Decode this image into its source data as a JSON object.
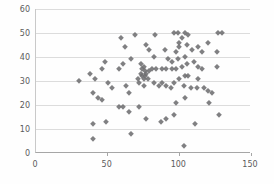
{
  "chart_data": {
    "type": "scatter",
    "title": "",
    "xlabel": "",
    "ylabel": "",
    "xlim": [
      0,
      150
    ],
    "ylim": [
      0,
      60
    ],
    "x_ticks": [
      0,
      50,
      100,
      150
    ],
    "y_ticks": [
      0,
      10,
      20,
      30,
      40,
      50,
      60
    ],
    "grid": "horizontal",
    "legend": "none",
    "marker": {
      "shape": "diamond",
      "color": "#6e6e71",
      "size_px": 5
    },
    "colors": {
      "background": "#fefefe",
      "gridline": "#dcdcdc",
      "axis_line": "#a6a6a6",
      "tick_text": "#5b5b5b"
    },
    "points": [
      [
        30,
        30
      ],
      [
        38,
        33
      ],
      [
        41,
        31
      ],
      [
        40,
        25
      ],
      [
        43,
        23
      ],
      [
        46,
        22
      ],
      [
        48,
        38
      ],
      [
        46,
        35
      ],
      [
        50,
        29
      ],
      [
        53,
        27
      ],
      [
        40,
        12
      ],
      [
        49,
        13
      ],
      [
        40,
        6
      ],
      [
        59,
        48
      ],
      [
        69,
        49
      ],
      [
        58,
        35
      ],
      [
        61,
        37
      ],
      [
        66,
        39
      ],
      [
        62,
        44
      ],
      [
        63,
        28
      ],
      [
        65,
        25
      ],
      [
        58,
        19
      ],
      [
        61,
        19
      ],
      [
        65,
        17
      ],
      [
        66,
        8
      ],
      [
        72,
        19
      ],
      [
        71,
        31
      ],
      [
        77,
        45
      ],
      [
        73,
        37
      ],
      [
        74,
        35
      ],
      [
        75,
        36
      ],
      [
        76,
        34
      ],
      [
        73,
        33
      ],
      [
        74,
        32
      ],
      [
        76,
        32
      ],
      [
        77,
        33
      ],
      [
        78,
        31
      ],
      [
        75,
        31
      ],
      [
        79,
        43
      ],
      [
        82,
        40
      ],
      [
        79,
        34
      ],
      [
        81,
        35
      ],
      [
        84,
        35
      ],
      [
        88,
        35
      ],
      [
        91,
        35
      ],
      [
        95,
        35
      ],
      [
        98,
        35
      ],
      [
        92,
        39
      ],
      [
        95,
        38
      ],
      [
        83,
        49
      ],
      [
        90,
        43
      ],
      [
        72,
        29
      ],
      [
        75,
        28
      ],
      [
        82,
        29
      ],
      [
        86,
        28
      ],
      [
        88,
        29
      ],
      [
        91,
        28
      ],
      [
        94,
        27
      ],
      [
        96,
        29
      ],
      [
        77,
        14
      ],
      [
        87,
        13
      ],
      [
        91,
        14
      ],
      [
        96,
        16
      ],
      [
        103,
        3
      ],
      [
        111,
        12
      ],
      [
        104,
        23
      ],
      [
        98,
        21
      ],
      [
        96,
        50
      ],
      [
        99,
        50
      ],
      [
        102,
        48
      ],
      [
        104,
        50
      ],
      [
        106,
        49
      ],
      [
        100,
        46
      ],
      [
        100,
        44
      ],
      [
        98,
        42
      ],
      [
        105,
        45
      ],
      [
        104,
        40
      ],
      [
        109,
        43
      ],
      [
        113,
        44
      ],
      [
        116,
        42
      ],
      [
        120,
        46
      ],
      [
        102,
        36
      ],
      [
        105,
        37
      ],
      [
        110,
        38
      ],
      [
        113,
        36
      ],
      [
        113,
        31
      ],
      [
        116,
        35
      ],
      [
        99,
        39
      ],
      [
        100,
        31
      ],
      [
        104,
        32
      ],
      [
        106,
        32
      ],
      [
        103,
        28
      ],
      [
        108,
        27
      ],
      [
        112,
        27
      ],
      [
        117,
        27
      ],
      [
        120,
        26
      ],
      [
        126,
        42
      ],
      [
        126,
        36
      ],
      [
        127,
        50
      ],
      [
        130,
        50
      ],
      [
        121,
        21
      ],
      [
        123,
        25
      ],
      [
        128,
        16
      ]
    ]
  }
}
